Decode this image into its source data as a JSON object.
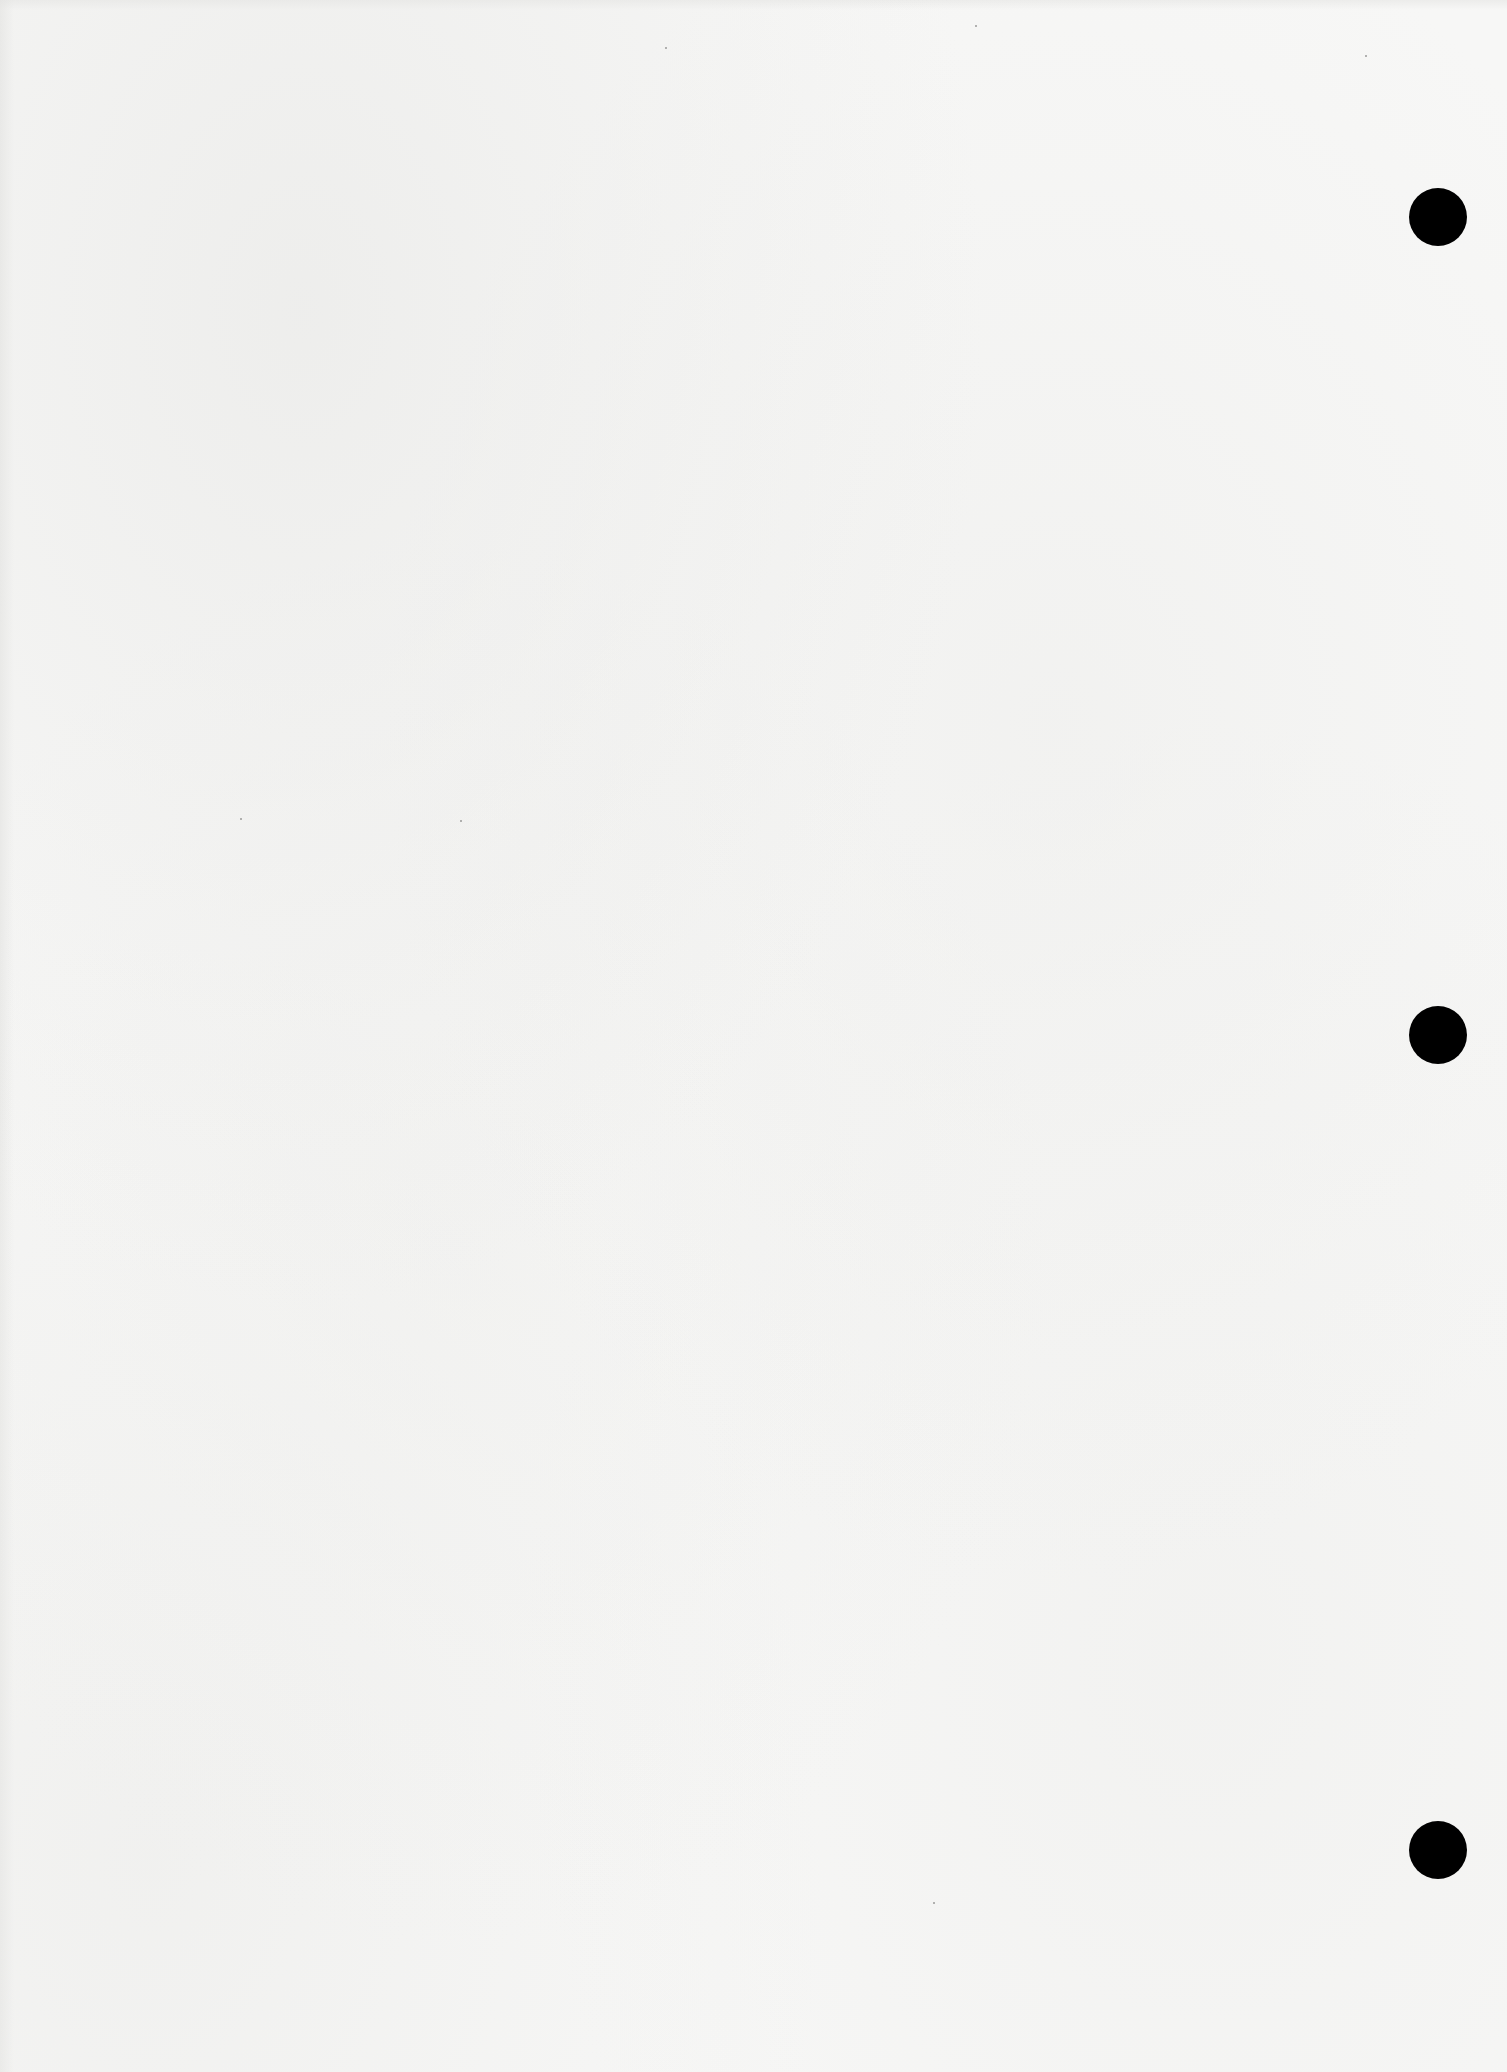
{
  "document": {
    "type": "blank-page",
    "background_color": "#f7f7f6",
    "text_content": ""
  },
  "punch_holes": [
    {
      "label": "top-hole",
      "cx": 1438,
      "cy": 217,
      "diameter": 58,
      "color": "#000000"
    },
    {
      "label": "middle-hole",
      "cx": 1438,
      "cy": 1035,
      "diameter": 58,
      "color": "#000000"
    },
    {
      "label": "bottom-hole",
      "cx": 1438,
      "cy": 1850,
      "diameter": 58,
      "color": "#000000"
    }
  ]
}
